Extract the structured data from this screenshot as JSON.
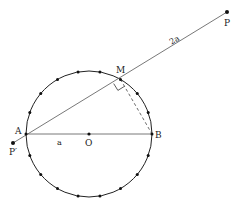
{
  "figure": {
    "type": "geometry-diagram",
    "circle": {
      "center_label": "O",
      "center": [
        89,
        134
      ],
      "radius": 63,
      "dot_count": 18,
      "dot_step_degrees": 20
    },
    "points": {
      "A": {
        "label": "A",
        "x": 26,
        "y": 134
      },
      "B": {
        "label": "B",
        "x": 152,
        "y": 134
      },
      "O": {
        "label": "O",
        "x": 89,
        "y": 134
      },
      "M": {
        "label": "M",
        "x": 120.5,
        "y": 79.4
      },
      "P": {
        "label": "P",
        "x": 227,
        "y": 12
      },
      "P_prime": {
        "label": "P′",
        "x": 13,
        "y": 143
      }
    },
    "segment_labels": {
      "AO": "a",
      "MP": "2a"
    },
    "annotations": {
      "right_angle_at": "M",
      "dashed_segment": "MB"
    }
  }
}
